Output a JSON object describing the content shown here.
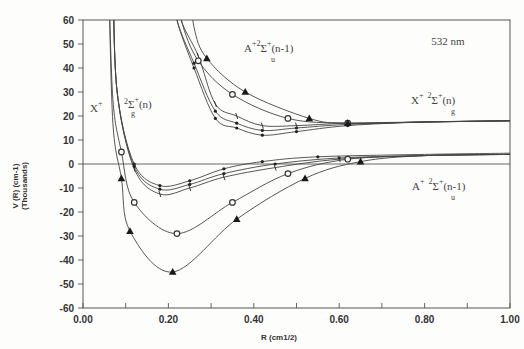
{
  "chart_data": {
    "type": "line",
    "title": "",
    "annotation_wavelength": "532 nm",
    "xlabel": "R (cm1/2)",
    "ylabel": "V (R) (cm-1)",
    "ylabel_sub": "(Thousands)",
    "xlim": [
      0.0,
      1.0
    ],
    "ylim": [
      -60,
      60
    ],
    "x_ticks": [
      "0.00",
      "0.20",
      "0.40",
      "0.60",
      "0.80",
      "1.00"
    ],
    "y_ticks": [
      "60",
      "50",
      "40",
      "30",
      "20",
      "10",
      "0",
      "-10",
      "-20",
      "-30",
      "-40",
      "-50",
      "-60"
    ],
    "grid": false,
    "legend": "none (curve labels annotated in plot)",
    "curve_labels": [
      {
        "text_main": "X",
        "sup": "+",
        "sup2": "2",
        "sigma": "Σ",
        "sub": "g",
        "sup3": "+",
        "suffix": "(n)",
        "position": "left-middle"
      },
      {
        "text_main": "A",
        "sup": "+2",
        "sigma": "Σ",
        "sub": "u",
        "sup3": "+",
        "suffix": "(n-1)",
        "position": "top-center"
      },
      {
        "text_main": "X",
        "sup": "+",
        "sup2": "2",
        "sigma": "Σ",
        "sub": "g",
        "sup3": "+",
        "suffix": "(n)",
        "position": "right-upper"
      },
      {
        "text_main": "A",
        "sup": "+",
        "sup2": "2",
        "sigma": "Σ",
        "sub": "u",
        "sup3": "+",
        "suffix": "(n-1)",
        "position": "right-lower"
      }
    ],
    "asymptotes": {
      "X_state_upper": 18,
      "A_state_lower": 4,
      "zero_line": 0
    },
    "series": [
      {
        "name": "field-free X (dot)",
        "marker": "dot",
        "x": [
          0.08,
          0.12,
          0.18,
          0.25,
          0.33,
          0.42,
          0.55,
          0.8,
          1.0
        ],
        "y": [
          30,
          0,
          -9,
          -7,
          -2,
          1,
          3,
          4,
          4.5
        ]
      },
      {
        "name": "dressed X small-dot",
        "marker": "dot",
        "x": [
          0.08,
          0.12,
          0.18,
          0.25,
          0.33,
          0.45,
          0.6,
          0.8,
          1.0
        ],
        "y": [
          30,
          -1,
          -10.5,
          -8.5,
          -4,
          0,
          2.5,
          3.5,
          4
        ]
      },
      {
        "name": "dressed X tick",
        "marker": "tick",
        "x": [
          0.08,
          0.12,
          0.18,
          0.25,
          0.33,
          0.45,
          0.6,
          0.8,
          1.0
        ],
        "y": [
          30,
          -2,
          -12.5,
          -10,
          -5.5,
          -1.5,
          2,
          3.5,
          4
        ]
      },
      {
        "name": "dressed X circle",
        "marker": "circle",
        "x": [
          0.07,
          0.09,
          0.12,
          0.22,
          0.35,
          0.48,
          0.62,
          0.8,
          1.0
        ],
        "y": [
          27,
          5,
          -16,
          -29,
          -16,
          -4,
          2,
          3.5,
          4
        ]
      },
      {
        "name": "dressed X triangle",
        "marker": "triangle",
        "x": [
          0.07,
          0.09,
          0.11,
          0.21,
          0.36,
          0.52,
          0.65,
          0.8,
          1.0
        ],
        "y": [
          17,
          -6,
          -28,
          -45,
          -23,
          -6,
          1,
          3.5,
          4
        ]
      },
      {
        "name": "A state dot",
        "marker": "dot",
        "x": [
          0.22,
          0.26,
          0.31,
          0.36,
          0.42,
          0.5,
          0.62,
          0.8,
          1.0
        ],
        "y": [
          60,
          40,
          19,
          15,
          12,
          13.5,
          16,
          17.5,
          18
        ]
      },
      {
        "name": "A state small-dot",
        "marker": "dot",
        "x": [
          0.22,
          0.26,
          0.31,
          0.36,
          0.42,
          0.5,
          0.62,
          0.8,
          1.0
        ],
        "y": [
          60,
          42,
          22,
          17,
          14,
          15,
          16.5,
          17.5,
          18
        ]
      },
      {
        "name": "A state tick",
        "marker": "tick",
        "x": [
          0.23,
          0.27,
          0.31,
          0.36,
          0.42,
          0.5,
          0.62,
          0.8,
          1.0
        ],
        "y": [
          60,
          45,
          25,
          20,
          16,
          16,
          17,
          17.5,
          18
        ]
      },
      {
        "name": "A state circle",
        "marker": "circle",
        "x": [
          0.23,
          0.27,
          0.35,
          0.48,
          0.62,
          0.8,
          1.0
        ],
        "y": [
          60,
          43,
          29,
          19,
          17,
          17.5,
          18
        ]
      },
      {
        "name": "A state triangle",
        "marker": "triangle",
        "x": [
          0.26,
          0.29,
          0.38,
          0.53,
          0.62,
          0.8,
          1.0
        ],
        "y": [
          57,
          44,
          30,
          19,
          17,
          17.5,
          18
        ]
      }
    ]
  }
}
